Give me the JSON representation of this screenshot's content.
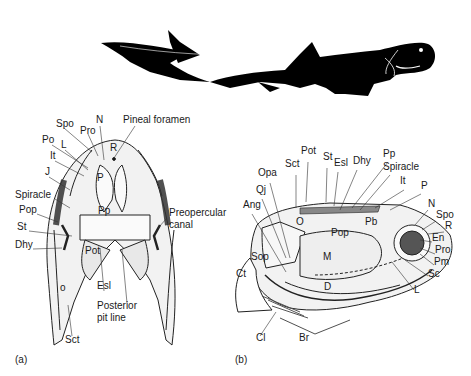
{
  "figure": {
    "silhouette": {
      "name": "Dunkleosteus-like placoderm silhouette",
      "fill": "#000000"
    },
    "panel_a": {
      "caption": "(a)",
      "view": "dorsal view of head shield",
      "labels": [
        {
          "text": "Spo",
          "x": 56,
          "y": 124
        },
        {
          "text": "Pro",
          "x": 80,
          "y": 131
        },
        {
          "text": "N",
          "x": 96,
          "y": 120
        },
        {
          "text": "Pineal foramen",
          "x": 123,
          "y": 120
        },
        {
          "text": "Po",
          "x": 42,
          "y": 140
        },
        {
          "text": "L",
          "x": 61,
          "y": 145
        },
        {
          "text": "It",
          "x": 50,
          "y": 156
        },
        {
          "text": "J",
          "x": 45,
          "y": 172
        },
        {
          "text": "R",
          "x": 110,
          "y": 148
        },
        {
          "text": "P",
          "x": 97,
          "y": 178
        },
        {
          "text": "Spiracle",
          "x": 15,
          "y": 195
        },
        {
          "text": "Pop",
          "x": 19,
          "y": 210
        },
        {
          "text": "Pp",
          "x": 98,
          "y": 211
        },
        {
          "text": "Preopercular",
          "x": 169,
          "y": 213
        },
        {
          "text": "canal",
          "x": 169,
          "y": 225
        },
        {
          "text": "St",
          "x": 17,
          "y": 227
        },
        {
          "text": "Dhy",
          "x": 15,
          "y": 245
        },
        {
          "text": "Pot",
          "x": 85,
          "y": 251
        },
        {
          "text": "o",
          "x": 60,
          "y": 288
        },
        {
          "text": "Esl",
          "x": 97,
          "y": 286
        },
        {
          "text": "Posterior",
          "x": 97,
          "y": 306
        },
        {
          "text": "pit line",
          "x": 97,
          "y": 318
        },
        {
          "text": "Sct",
          "x": 65,
          "y": 340
        }
      ]
    },
    "panel_b": {
      "caption": "(b)",
      "view": "lateral view of head and trunk armour",
      "labels": [
        {
          "text": "Pot",
          "x": 301,
          "y": 151
        },
        {
          "text": "St",
          "x": 323,
          "y": 157
        },
        {
          "text": "Sct",
          "x": 285,
          "y": 164
        },
        {
          "text": "Esl",
          "x": 334,
          "y": 163
        },
        {
          "text": "Dhy",
          "x": 353,
          "y": 161
        },
        {
          "text": "Pp",
          "x": 383,
          "y": 154
        },
        {
          "text": "Spiracle",
          "x": 383,
          "y": 167
        },
        {
          "text": "Opa",
          "x": 258,
          "y": 173
        },
        {
          "text": "It",
          "x": 400,
          "y": 181
        },
        {
          "text": "P",
          "x": 421,
          "y": 186
        },
        {
          "text": "Qj",
          "x": 256,
          "y": 190
        },
        {
          "text": "Ang",
          "x": 243,
          "y": 205
        },
        {
          "text": "N",
          "x": 428,
          "y": 204
        },
        {
          "text": "Spo",
          "x": 436,
          "y": 215
        },
        {
          "text": "O",
          "x": 296,
          "y": 222
        },
        {
          "text": "R",
          "x": 445,
          "y": 226
        },
        {
          "text": "Pb",
          "x": 365,
          "y": 222
        },
        {
          "text": "Pop",
          "x": 331,
          "y": 233
        },
        {
          "text": "En",
          "x": 432,
          "y": 238
        },
        {
          "text": "Pro",
          "x": 435,
          "y": 250
        },
        {
          "text": "Sop",
          "x": 251,
          "y": 257
        },
        {
          "text": "M",
          "x": 323,
          "y": 257
        },
        {
          "text": "Pm",
          "x": 434,
          "y": 262
        },
        {
          "text": "Ct",
          "x": 236,
          "y": 274
        },
        {
          "text": "Sc",
          "x": 428,
          "y": 274
        },
        {
          "text": "D",
          "x": 324,
          "y": 287
        },
        {
          "text": "L",
          "x": 414,
          "y": 290
        },
        {
          "text": "Cl",
          "x": 256,
          "y": 338
        },
        {
          "text": "Br",
          "x": 299,
          "y": 338
        }
      ]
    }
  }
}
